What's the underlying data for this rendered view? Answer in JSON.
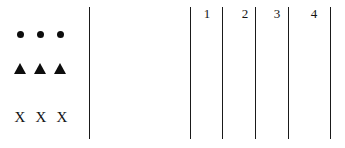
{
  "figure": {
    "background_color": "#ffffff",
    "ink_color": "#0d0d0d",
    "rule_color": "#1a1a1a"
  },
  "symbol_panel": {
    "rows": [
      {
        "name": "circle-row",
        "glyph": "filled-circle",
        "count": 3,
        "label": "● ● ●",
        "y": 34,
        "items": [
          {
            "text": "●",
            "x": 20
          },
          {
            "text": "●",
            "x": 40
          },
          {
            "text": "●",
            "x": 60
          }
        ]
      },
      {
        "name": "triangle-row",
        "glyph": "filled-triangle",
        "count": 3,
        "label": "▲ ▲ ▲",
        "y": 68,
        "items": [
          {
            "text": "▲",
            "x": 20
          },
          {
            "text": "▲",
            "x": 40
          },
          {
            "text": "▲",
            "x": 60
          }
        ]
      },
      {
        "name": "x-row",
        "glyph": "letter-x",
        "count": 3,
        "label": "X X X",
        "y": 117,
        "items": [
          {
            "text": "X",
            "x": 20
          },
          {
            "text": "X",
            "x": 41
          },
          {
            "text": "X",
            "x": 62
          }
        ]
      }
    ]
  },
  "divider": {
    "name": "panel-divider",
    "x": 89,
    "top": 7,
    "bottom": 139
  },
  "column_panel": {
    "rules": [
      {
        "x": 190,
        "top": 7,
        "bottom": 139
      },
      {
        "x": 222,
        "top": 7,
        "bottom": 139
      },
      {
        "x": 255,
        "top": 7,
        "bottom": 139
      },
      {
        "x": 288,
        "top": 7,
        "bottom": 139
      },
      {
        "x": 330,
        "top": 7,
        "bottom": 139
      }
    ],
    "labels": [
      {
        "text": "1",
        "x": 200,
        "y": 7
      },
      {
        "text": "2",
        "x": 238,
        "y": 7
      },
      {
        "text": "3",
        "x": 270,
        "y": 7
      },
      {
        "text": "4",
        "x": 307,
        "y": 7
      }
    ]
  }
}
